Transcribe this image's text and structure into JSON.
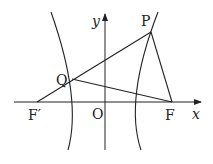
{
  "diagram": {
    "type": "hyperbola-foci",
    "labels": {
      "P": "P",
      "Q": "Q",
      "F": "F",
      "F_prime": "F′",
      "O": "O",
      "x_axis": "x",
      "y_axis": "y"
    },
    "points": {
      "P": [
        151,
        32
      ],
      "Q": [
        72,
        79
      ],
      "F": [
        172,
        102
      ],
      "F_prime": [
        37,
        102
      ],
      "O": [
        105,
        102
      ]
    },
    "segments": [
      [
        "F_prime",
        "P"
      ],
      [
        "Q",
        "F"
      ],
      [
        "P",
        "F"
      ]
    ],
    "colors": {
      "stroke": "#222222",
      "background": "#ffffff"
    }
  }
}
